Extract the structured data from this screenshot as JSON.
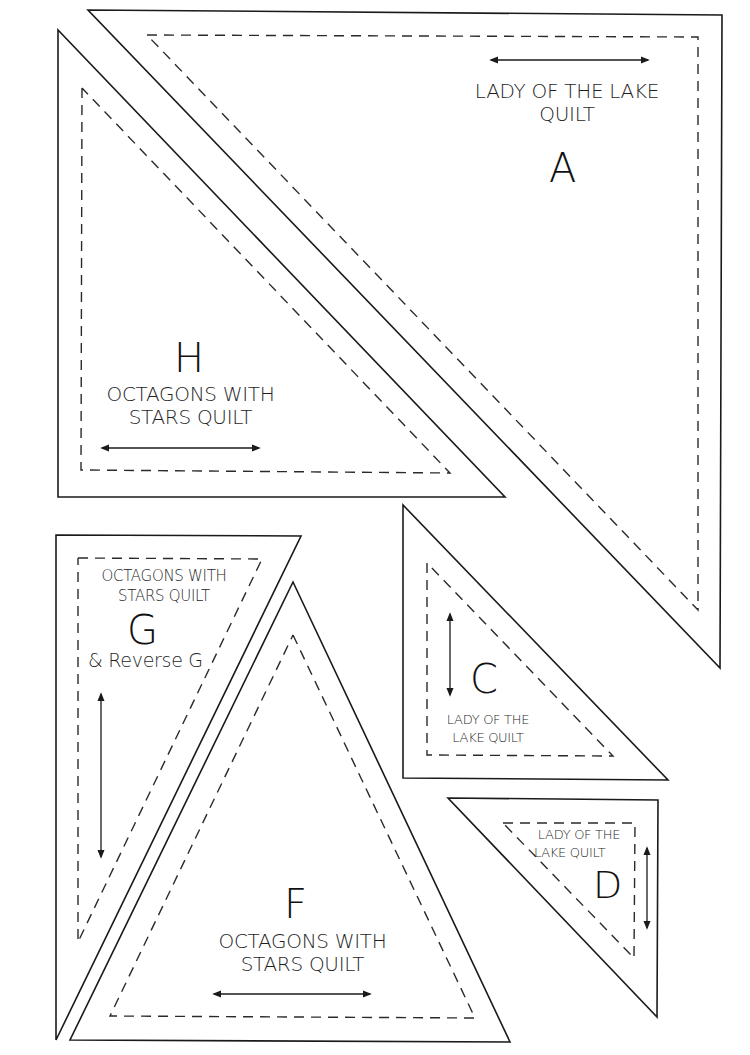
{
  "page": {
    "type": "quilt template sheet",
    "background": "#ffffff",
    "line_color": "#1a1a1a"
  },
  "pieces": [
    {
      "id": "A",
      "letter": "A",
      "quilt_line1": "LADY OF THE LAKE",
      "quilt_line2": "QUILT",
      "grain": "horizontal"
    },
    {
      "id": "H",
      "letter": "H",
      "quilt_line1": "OCTAGONS WITH",
      "quilt_line2": "STARS QUILT",
      "grain": "horizontal"
    },
    {
      "id": "C",
      "letter": "C",
      "quilt_line1": "LADY OF THE",
      "quilt_line2": "LAKE QUILT",
      "grain": "vertical"
    },
    {
      "id": "D",
      "letter": "D",
      "quilt_line1": "LADY OF THE",
      "quilt_line2": "LAKE QUILT",
      "grain": "vertical"
    },
    {
      "id": "G",
      "letter": "G",
      "quilt_line1": "OCTAGONS WITH",
      "quilt_line2": "STARS QUILT",
      "extra": "& Reverse G",
      "grain": "vertical"
    },
    {
      "id": "F",
      "letter": "F",
      "quilt_line1": "OCTAGONS WITH",
      "quilt_line2": "STARS QUILT",
      "grain": "horizontal"
    }
  ]
}
